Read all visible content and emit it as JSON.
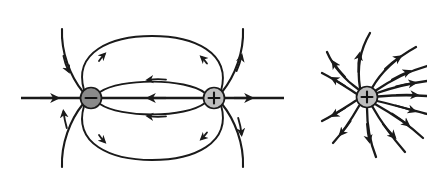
{
  "figure": {
    "background_color": "#ffffff",
    "line_color": "#1a1a1a",
    "panels": [
      {
        "id": "electric-dipole",
        "name": "Electric dipole field pattern",
        "charges": [
          {
            "id": "negative-charge",
            "sign": "−",
            "polarity": "negative",
            "cx": 91,
            "cy": 98,
            "r": 10.5,
            "fill_color": "#8a8a8a",
            "stroke_color": "#1a1a1a",
            "sign_color": "#111111"
          },
          {
            "id": "positive-charge",
            "sign": "+",
            "polarity": "positive",
            "cx": 214,
            "cy": 98,
            "r": 10.5,
            "fill_color": "#bdbdbd",
            "stroke_color": "#1a1a1a",
            "sign_color": "#111111"
          }
        ],
        "field_direction": "from positive charge to negative charge",
        "line_count": 12
      },
      {
        "id": "isolated-positive-charge",
        "name": "Isolated positive point charge radial field",
        "charges": [
          {
            "id": "positive-charge-isolated",
            "sign": "+",
            "polarity": "positive",
            "cx": 367,
            "cy": 97,
            "r": 10.5,
            "fill_color": "#bdbdbd",
            "stroke_color": "#1a1a1a",
            "sign_color": "#111111"
          }
        ],
        "field_direction": "radially outward from the positive charge",
        "line_count": 13
      }
    ]
  }
}
